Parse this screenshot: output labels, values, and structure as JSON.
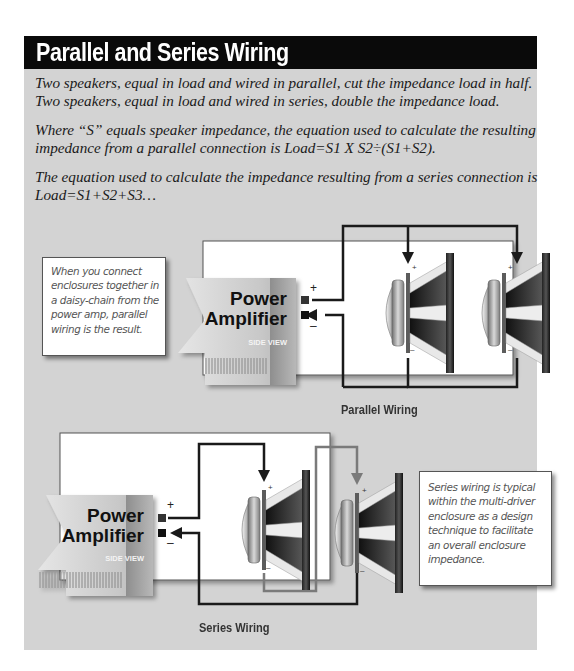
{
  "header": {
    "title": "Parallel and Series Wiring"
  },
  "body": {
    "paragraph1": [
      "Two speakers, equal in load and wired in parallel, cut the impedance load in half.",
      "Two speakers, equal in load and wired in series, double the impedance load."
    ],
    "paragraph2": [
      "Where “S” equals speaker impedance, the equation used to calculate the resulting",
      "impedance  from a parallel  connection is Load=S1 X S2÷(S1+S2)."
    ],
    "paragraph3": [
      "The equation used to calculate the impedance resulting from a series  connection is",
      "Load=S1+S2+S3…"
    ]
  },
  "parallel_diagram": {
    "caption": "Parallel Wiring",
    "amplifier": {
      "line1": "Power",
      "line2": "Amplifier",
      "view": "SIDE VIEW"
    },
    "terminal_plus": "+",
    "terminal_minus": "–",
    "speaker_count": 2,
    "note": [
      "When you connect",
      "enclosures together in",
      "a daisy-chain from the",
      "power amp, parallel",
      "wiring is the result."
    ]
  },
  "series_diagram": {
    "caption": "Series Wiring",
    "amplifier": {
      "line1": "Power",
      "line2": "Amplifier",
      "view": "SIDE VIEW"
    },
    "terminal_plus": "+",
    "terminal_minus": "–",
    "speaker_count": 2,
    "note": [
      "Series wiring is typical",
      "within the multi-driver",
      "enclosure as a design",
      "technique to facilitate",
      "an overall enclosure",
      "impedance."
    ]
  },
  "colors": {
    "panel_bg": "#d3d3d3",
    "header_bg": "#0a0a0a",
    "header_text": "#ffffff",
    "wire_dark": "#1a1a1a",
    "wire_gray": "#7a7a7a",
    "enclosure_bg": "#ffffff"
  }
}
